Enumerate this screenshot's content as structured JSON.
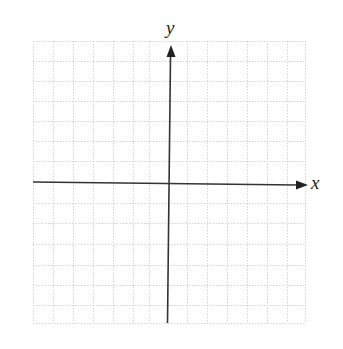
{
  "diagram": {
    "type": "cartesian-coordinate-plane",
    "x_axis_label": "x",
    "y_axis_label": "y",
    "grid": {
      "columns": 14,
      "rows": 14,
      "line_style": "dotted",
      "line_color": "#d4d4d4"
    },
    "axis_color": "#333333",
    "arrows": [
      "positive-x",
      "positive-y"
    ]
  }
}
